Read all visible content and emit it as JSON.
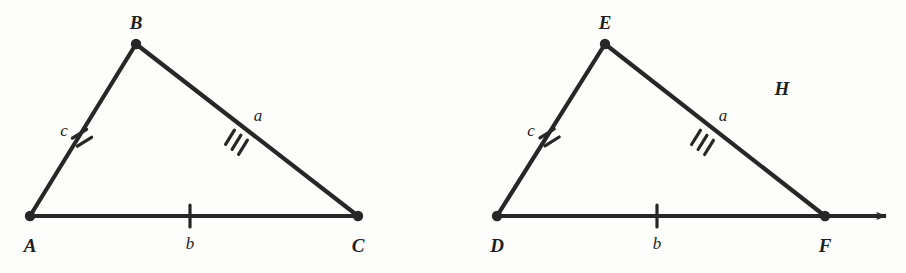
{
  "figure": {
    "background_color": "#fdfdfb",
    "stroke_color": "#272727",
    "triangles": [
      {
        "name": "triangle-abc",
        "vertices": [
          {
            "label": "A",
            "x": 30,
            "y": 216,
            "label_x": 30,
            "label_y": 245
          },
          {
            "label": "B",
            "x": 136,
            "y": 44,
            "label_x": 136,
            "label_y": 22
          },
          {
            "label": "C",
            "x": 358,
            "y": 216,
            "label_x": 358,
            "label_y": 245
          }
        ],
        "sides": [
          {
            "label": "c",
            "ticks": 2,
            "from": "A",
            "to": "B",
            "label_x": 64,
            "label_y": 130
          },
          {
            "label": "a",
            "ticks": 3,
            "from": "B",
            "to": "C",
            "label_x": 258,
            "label_y": 115
          },
          {
            "label": "b",
            "ticks": 1,
            "from": "A",
            "to": "C",
            "label_x": 190,
            "label_y": 243
          }
        ],
        "has_ray_arrow": false
      },
      {
        "name": "triangle-def",
        "vertices": [
          {
            "label": "D",
            "x": 497,
            "y": 216,
            "label_x": 497,
            "label_y": 245
          },
          {
            "label": "E",
            "x": 605,
            "y": 44,
            "label_x": 605,
            "label_y": 22
          },
          {
            "label": "F",
            "x": 825,
            "y": 216,
            "label_x": 825,
            "label_y": 245
          }
        ],
        "sides": [
          {
            "label": "c",
            "ticks": 2,
            "from": "D",
            "to": "E",
            "label_x": 531,
            "label_y": 130
          },
          {
            "label": "a",
            "ticks": 3,
            "from": "E",
            "to": "F",
            "label_x": 723,
            "label_y": 115
          },
          {
            "label": "b",
            "ticks": 1,
            "from": "D",
            "to": "F",
            "label_x": 657,
            "label_y": 243
          }
        ],
        "has_ray_arrow": true,
        "ray_arrow_tip_x": 893,
        "ray_arrow_y": 216
      }
    ],
    "plane_label": {
      "text": "H",
      "x": 782,
      "y": 88
    }
  }
}
